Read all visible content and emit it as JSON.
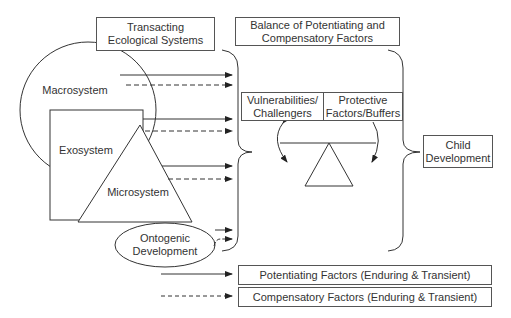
{
  "diagram": {
    "headers": {
      "transacting": "Transacting Ecological Systems",
      "transacting_lines": [
        "Transacting",
        "Ecological Systems"
      ],
      "balance_lines": [
        "Balance of Potentiating and",
        "Compensatory Factors"
      ]
    },
    "systems": {
      "macrosystem": "Macrosystem",
      "exosystem": "Exosystem",
      "microsystem": "Microsystem",
      "ontogenic_lines": [
        "Ontogenic",
        "Development"
      ]
    },
    "balance": {
      "left_lines": [
        "Vulnerabilities/",
        "Challengers"
      ],
      "right_lines": [
        "Protective",
        "Factors/Buffers"
      ]
    },
    "outcome_lines": [
      "Child",
      "Development"
    ],
    "legend": {
      "solid": "Potentiating Factors (Enduring & Transient)",
      "dashed": "Compensatory Factors (Enduring & Transient)"
    },
    "colors": {
      "stroke": "#333333",
      "background": "#ffffff",
      "text": "#333333"
    }
  }
}
